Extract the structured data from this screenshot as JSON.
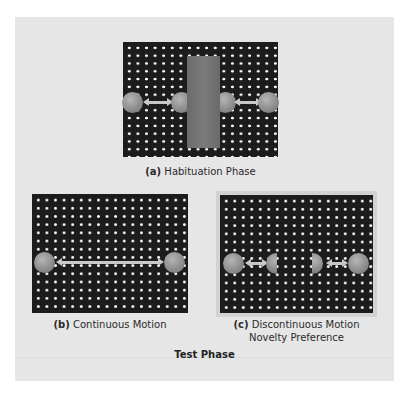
{
  "figure": {
    "habituation": {
      "tag": "(a)",
      "label": "Habituation Phase"
    },
    "continuous": {
      "tag": "(b)",
      "label": "Continuous Motion"
    },
    "discontinuous": {
      "tag": "(c)",
      "label": "Discontinuous Motion",
      "sublabel": "Novelty Preference"
    },
    "test_phase_label": "Test Phase"
  },
  "colors": {
    "board": "#1c1c1c",
    "dots": "#ffffff",
    "ball": "#8a8a8a",
    "occluder": "#727272",
    "panel_background": "#e6e6e6"
  }
}
